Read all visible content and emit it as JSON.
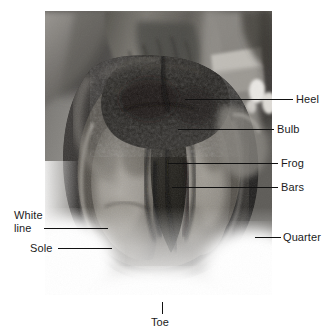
{
  "figure": {
    "type": "anatomical-photograph",
    "alt": "Grayscale photograph of the underside (sole) of a horse's hoof, held up, with anatomical parts labeled by leader lines",
    "colors": {
      "background": "#ffffff",
      "label_text": "#1b1b1b",
      "leader_line": "#111111",
      "photo_light": "#d8d6d2",
      "photo_mid": "#8e8c88",
      "photo_dark": "#2b2a28"
    }
  },
  "labels": [
    {
      "id": "heel",
      "text": "Heel",
      "side": "right"
    },
    {
      "id": "bulb",
      "text": "Bulb",
      "side": "right"
    },
    {
      "id": "frog",
      "text": "Frog",
      "side": "right"
    },
    {
      "id": "bars",
      "text": "Bars",
      "side": "right"
    },
    {
      "id": "quarter",
      "text": "Quarter",
      "side": "right"
    },
    {
      "id": "white-line",
      "text": "White",
      "text2": "line",
      "side": "left"
    },
    {
      "id": "sole",
      "text": "Sole",
      "side": "left"
    },
    {
      "id": "toe",
      "text": "Toe",
      "side": "bottom"
    }
  ]
}
